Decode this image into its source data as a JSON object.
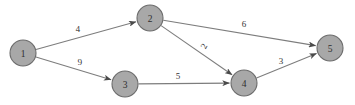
{
  "figure": {
    "background_color": "#ffffff",
    "node_fill": "#a8a8a8",
    "node_stroke": "#6b6b6b",
    "edge_color": "#7d7d7d",
    "arrow_color": "#4a4a4a",
    "label_color": "#2e2e2e"
  },
  "chart_data": {
    "type": "diagram",
    "diagram_kind": "directed-weighted-graph",
    "title": "",
    "nodes": [
      {
        "id": "1",
        "label": "1",
        "x": 23,
        "y": 53,
        "r": 13
      },
      {
        "id": "2",
        "label": "2",
        "x": 150,
        "y": 18,
        "r": 13
      },
      {
        "id": "3",
        "label": "3",
        "x": 125,
        "y": 84,
        "r": 13
      },
      {
        "id": "4",
        "label": "4",
        "x": 244,
        "y": 83,
        "r": 13
      },
      {
        "id": "5",
        "label": "5",
        "x": 330,
        "y": 48,
        "r": 13
      }
    ],
    "edges": [
      {
        "from": "1",
        "to": "2",
        "weight": "4",
        "label_x": 78,
        "label_y": 29,
        "label_rotate": -2
      },
      {
        "from": "1",
        "to": "3",
        "weight": "9",
        "label_x": 80,
        "label_y": 62,
        "label_rotate": -2
      },
      {
        "from": "2",
        "to": "5",
        "weight": "6",
        "label_x": 244,
        "label_y": 24,
        "label_rotate": 0
      },
      {
        "from": "2",
        "to": "4",
        "weight": "2",
        "label_x": 204,
        "label_y": 46,
        "label_rotate": -62
      },
      {
        "from": "3",
        "to": "4",
        "weight": "5",
        "label_x": 178,
        "label_y": 76,
        "label_rotate": 0
      },
      {
        "from": "4",
        "to": "5",
        "weight": "3",
        "label_x": 281,
        "label_y": 61,
        "label_rotate": 0
      }
    ],
    "directed": true,
    "weighted": true
  }
}
